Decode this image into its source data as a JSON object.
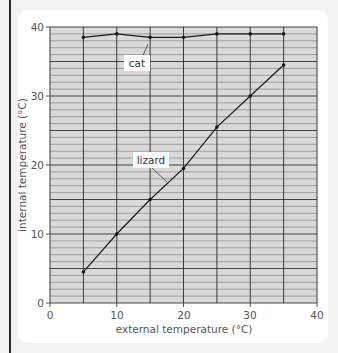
{
  "chart_data": {
    "type": "line",
    "title": "",
    "xlabel": "external temperature (°C)",
    "ylabel": "internal temperature (°C)",
    "xlim": [
      0,
      40
    ],
    "ylim": [
      0,
      40
    ],
    "x_ticks": [
      0,
      10,
      20,
      30,
      40
    ],
    "y_ticks": [
      0,
      10,
      20,
      30,
      40
    ],
    "grid": true,
    "x": [
      5,
      10,
      15,
      20,
      25,
      30,
      35
    ],
    "series": [
      {
        "name": "cat",
        "values": [
          38.5,
          39,
          38.5,
          38.5,
          39,
          39,
          39
        ]
      },
      {
        "name": "lizard",
        "values": [
          4.5,
          10,
          15,
          19.5,
          25.5,
          30,
          34.5
        ]
      }
    ],
    "annotations": [
      {
        "text": "cat",
        "points_to": [
          15,
          38.5
        ]
      },
      {
        "text": "lizard",
        "points_to": [
          18,
          17.5
        ]
      }
    ]
  },
  "labels": {
    "xlabel": "external temperature (°C)",
    "ylabel": "internal temperature (°C)",
    "cat": "cat",
    "lizard": "lizard",
    "xt0": "0",
    "xt1": "10",
    "xt2": "20",
    "xt3": "30",
    "xt4": "40",
    "yt0": "0",
    "yt1": "10",
    "yt2": "20",
    "yt3": "30",
    "yt4": "40"
  },
  "colors": {
    "plot_bg": "#d9d9d9",
    "grid": "#3a3a3a",
    "line": "#1a1a1a"
  }
}
